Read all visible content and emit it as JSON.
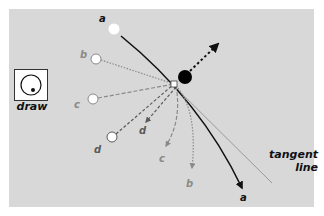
{
  "diagram": {
    "colors": {
      "background": "#d8d8d8",
      "path_a": "#111111",
      "path_b": "#8a8a8a",
      "path_c": "#8a8a8a",
      "path_d": "#5a5a5a",
      "tangent": "#9a9a9a",
      "ball": "#000000",
      "marker_fill": "#ffffff"
    },
    "draw_button": {
      "label": "draw",
      "icon": "circle-with-dot-icon"
    },
    "tangent": {
      "line1": "tangent",
      "line2": "line"
    },
    "start_labels": {
      "a": "a",
      "b": "b",
      "c": "c",
      "d": "d"
    },
    "end_labels": {
      "a": "a",
      "b": "b",
      "c": "c",
      "d": "d"
    },
    "ball": {
      "cx": 185,
      "cy": 77,
      "r": 7
    },
    "convergence_point": {
      "x": 174,
      "y": 84
    },
    "markers": [
      {
        "id": "a",
        "cx": 114,
        "cy": 29
      },
      {
        "id": "b",
        "cx": 96,
        "cy": 59
      },
      {
        "id": "c",
        "cx": 93,
        "cy": 99
      },
      {
        "id": "d",
        "cx": 112,
        "cy": 137
      }
    ]
  }
}
